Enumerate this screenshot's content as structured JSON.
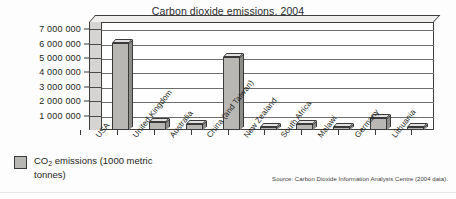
{
  "chart_data": {
    "type": "bar",
    "title": "Carbon dioxide emissions, 2004",
    "xlabel": "",
    "ylabel": "",
    "ylim": [
      0,
      7500000
    ],
    "grid": true,
    "legend_position": "bottom-left",
    "categories": [
      "USA",
      "United Kingdom",
      "Australia",
      "China (and Taiwan)",
      "New Zealand",
      "South Africa",
      "Malawi",
      "Germany",
      "Lithuania"
    ],
    "values": [
      6050000,
      560000,
      400000,
      5100000,
      240000,
      420000,
      60000,
      860000,
      100000
    ],
    "series": [
      {
        "name": "CO2 emissions (1000 metric tonnes)",
        "values": [
          6050000,
          560000,
          400000,
          5100000,
          240000,
          420000,
          60000,
          860000,
          100000
        ]
      }
    ],
    "ytick_labels": [
      "7 000 000",
      "6 000 000",
      "5 000 000",
      "4 000 000",
      "3 000 000",
      "2 000 000",
      "1 000 000"
    ],
    "ytick_values": [
      7000000,
      6000000,
      5000000,
      4000000,
      3000000,
      2000000,
      1000000
    ],
    "annotations": [
      "Source: Carbon Dioxide Information Analysis Centre (2004 data)."
    ]
  },
  "legend": {
    "label_line1": "CO",
    "label_sub": "2",
    "label_line2": " emissions (1000 metric tonnes)",
    "swatch_color": "#b9b7b4"
  },
  "source": {
    "text": "Source: Carbon Dioxide Information Analysis Centre (2004 data)."
  },
  "colors": {
    "bar_front": "#b9b7b4",
    "bar_top": "#e3e1df",
    "bar_side": "#8e8c89",
    "outline": "#3a3a3a",
    "panel": "#ffffff",
    "wall": "#d6d4d2",
    "background": "#fdfdfd"
  }
}
